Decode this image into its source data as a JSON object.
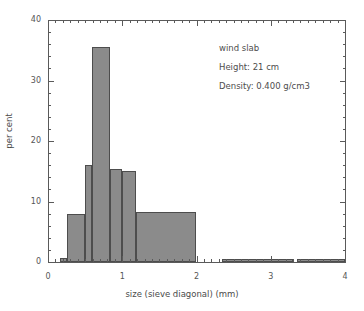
{
  "chart_data": {
    "type": "bar",
    "title": "",
    "subtitle": "",
    "xlabel": "size (sieve diagonal)  (mm)",
    "ylabel": "per cent",
    "xlim": [
      0,
      4
    ],
    "ylim": [
      0,
      40
    ],
    "grid": false,
    "legend_position": "none",
    "xticks": [
      0,
      1,
      2,
      3,
      4
    ],
    "xtick_labels": [
      "0",
      "1",
      "2",
      "3",
      "4"
    ],
    "yticks": [
      0,
      10,
      20,
      30,
      40
    ],
    "ytick_labels": [
      "0",
      "10",
      "20",
      "30",
      "40"
    ],
    "xminor_interval": 0.1,
    "yminor_interval": 2,
    "bar_fill_color": "#8b8b8b",
    "bar_edge_color": "#4d4d4d",
    "axis_color": "#5a5a5a",
    "text_color": "#4a4a4a",
    "background_color": "#ffffff",
    "bins": [
      {
        "x0": 0.16,
        "x1": 0.25,
        "value": 0.6
      },
      {
        "x0": 0.25,
        "x1": 0.5,
        "value": 7.9
      },
      {
        "x0": 0.5,
        "x1": 0.59,
        "value": 16.0
      },
      {
        "x0": 0.59,
        "x1": 0.84,
        "value": 35.6
      },
      {
        "x0": 0.84,
        "x1": 1.0,
        "value": 15.4
      },
      {
        "x0": 1.0,
        "x1": 1.18,
        "value": 15.1
      },
      {
        "x0": 1.18,
        "x1": 2.0,
        "value": 8.3
      },
      {
        "x0": 2.35,
        "x1": 3.3,
        "value": 0.5
      },
      {
        "x0": 3.35,
        "x1": 4.0,
        "value": 0.5
      }
    ],
    "annotations": [
      "wind slab",
      "Height: 21 cm",
      "Density: 0.400 g/cm3"
    ]
  }
}
